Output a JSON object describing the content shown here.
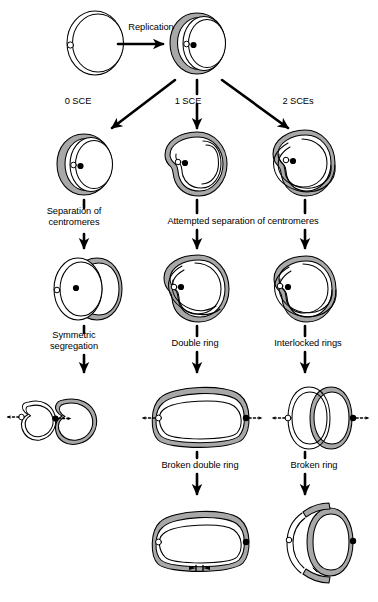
{
  "figure": {
    "width": 378,
    "height": 602,
    "background": "#ffffff",
    "ink_color": "#000000",
    "shaded_strand_color": "#a8a8a8",
    "unshaded_strand_color": "#ffffff"
  },
  "labels": {
    "replication": "Replication",
    "sce_zero": "0 SCE",
    "sce_one": "1 SCE",
    "sce_two": "2 SCEs",
    "separation_of_centromeres": "Separation of\ncentromeres",
    "attempted_separation": "Attempted separation of centromeres",
    "symmetric_segregation": "Symmetric\nsegregation",
    "double_ring": "Double ring",
    "interlocked_rings": "Interlocked rings",
    "broken_double_ring": "Broken double ring",
    "broken_ring": "Broken ring"
  },
  "label_positions": {
    "replication": {
      "x": 112,
      "y": 22,
      "w": 78
    },
    "sce_zero": {
      "x": 52,
      "y": 96,
      "w": 52
    },
    "sce_one": {
      "x": 162,
      "y": 96,
      "w": 52
    },
    "sce_two": {
      "x": 270,
      "y": 96,
      "w": 56
    },
    "separation_of_centromeres": {
      "x": 24,
      "y": 206,
      "w": 100
    },
    "attempted_separation": {
      "x": 128,
      "y": 216,
      "w": 230
    },
    "symmetric_segregation": {
      "x": 26,
      "y": 330,
      "w": 96
    },
    "double_ring": {
      "x": 156,
      "y": 338,
      "w": 78
    },
    "interlocked_rings": {
      "x": 258,
      "y": 338,
      "w": 100
    },
    "broken_double_ring": {
      "x": 138,
      "y": 460,
      "w": 124
    },
    "broken_ring": {
      "x": 268,
      "y": 460,
      "w": 92
    }
  },
  "stages": [
    {
      "id": "parent-ring",
      "name": "Parent ring chromosome",
      "row": 1,
      "column": "left",
      "description": "Single unreplicated ring chromosome, thin double outline, one unreplicated centromere shown as small open circle",
      "centromeres": [
        {
          "type": "open",
          "count": 1
        }
      ]
    },
    {
      "id": "replicated-ring",
      "name": "Replicated ring chromosome",
      "row": 1,
      "column": "center",
      "description": "Two sister chromatids after replication; one shaded gray, one unshaded white; open and filled centromeres adjacent",
      "centromeres": [
        {
          "type": "open",
          "count": 1
        },
        {
          "type": "filled",
          "count": 1
        }
      ]
    },
    {
      "id": "no-sce-ring",
      "name": "Ring after 0 SCE",
      "row": 2,
      "column": "left",
      "description": "Two free sister ring chromatids, one shaded one unshaded, lying side by side",
      "centromeres": [
        {
          "type": "open",
          "count": 1
        },
        {
          "type": "filled",
          "count": 1
        }
      ]
    },
    {
      "id": "one-sce-ring",
      "name": "Ring after 1 SCE",
      "row": 2,
      "column": "center",
      "description": "Single large double-sized ring formed by one sister chromatid exchange",
      "centromeres": [
        {
          "type": "open",
          "count": 1
        },
        {
          "type": "filled",
          "count": 1
        }
      ]
    },
    {
      "id": "two-sce-ring",
      "name": "Ring after 2 SCEs",
      "row": 2,
      "column": "right",
      "description": "Two interlocked (catenated) rings formed by two sister chromatid exchanges",
      "centromeres": [
        {
          "type": "open",
          "count": 1
        },
        {
          "type": "filled",
          "count": 1
        }
      ]
    },
    {
      "id": "symmetric-pair",
      "name": "Separated sister rings",
      "row": 3,
      "column": "left",
      "description": "Two independent rings side by side after successful centromere separation",
      "centromeres": [
        {
          "type": "open",
          "count": 1
        },
        {
          "type": "filled",
          "count": 1
        }
      ]
    },
    {
      "id": "double-ring-stage",
      "name": "Double ring",
      "row": 3,
      "column": "center",
      "description": "Single fused double-length ring; centromeres cannot separate",
      "centromeres": [
        {
          "type": "open",
          "count": 1
        },
        {
          "type": "filled",
          "count": 1
        }
      ]
    },
    {
      "id": "interlocked-stage",
      "name": "Interlocked rings",
      "row": 3,
      "column": "right",
      "description": "Two catenated rings that cannot be pulled apart",
      "centromeres": [
        {
          "type": "open",
          "count": 1
        },
        {
          "type": "filled",
          "count": 1
        }
      ]
    },
    {
      "id": "symmetric-result",
      "name": "Symmetric segregation result",
      "row": 4,
      "column": "left",
      "description": "Two separate rings pulled to opposite poles by spindle fibers; normal outcome",
      "centromeres": [
        {
          "type": "open",
          "count": 1
        },
        {
          "type": "filled",
          "count": 1
        }
      ],
      "spindle_arrows": 2
    },
    {
      "id": "stretched-double-ring",
      "name": "Stretched double ring",
      "row": 4,
      "column": "center",
      "description": "Double ring stretched into an elongated rounded rectangle by opposing spindle forces",
      "centromeres": [
        {
          "type": "open",
          "count": 1
        },
        {
          "type": "filled",
          "count": 1
        }
      ],
      "spindle_arrows": 2
    },
    {
      "id": "stretched-interlocked",
      "name": "Stretched interlocked rings",
      "row": 4,
      "column": "right",
      "description": "Interlocked rings pulled in opposite directions, deformed but still catenated",
      "centromeres": [
        {
          "type": "open",
          "count": 1
        },
        {
          "type": "filled",
          "count": 1
        }
      ],
      "spindle_arrows": 2
    },
    {
      "id": "broken-double-ring-result",
      "name": "Broken double ring",
      "row": 5,
      "column": "center",
      "description": "Double ring after breakage; gaps visible in the chromatid at the break points",
      "centromeres": [
        {
          "type": "open",
          "count": 1
        },
        {
          "type": "filled",
          "count": 1
        }
      ]
    },
    {
      "id": "broken-ring-result",
      "name": "Broken ring",
      "row": 5,
      "column": "right",
      "description": "Interlocked rings after breakage; outer ring fragmented into arcs, inner ring intact",
      "centromeres": [
        {
          "type": "open",
          "count": 1
        },
        {
          "type": "filled",
          "count": 1
        }
      ]
    }
  ],
  "connectors": [
    {
      "id": "arrow-replication",
      "type": "horizontal-arrow",
      "from": "parent-ring",
      "to": "replicated-ring",
      "label": "Replication"
    },
    {
      "id": "arrow-0-sce",
      "type": "diagonal-arrow",
      "from": "replicated-ring",
      "to": "no-sce-ring",
      "label": "0 SCE"
    },
    {
      "id": "arrow-1-sce",
      "type": "vertical-arrow",
      "from": "replicated-ring",
      "to": "one-sce-ring",
      "label": "1 SCE"
    },
    {
      "id": "arrow-2-sce",
      "type": "diagonal-arrow",
      "from": "replicated-ring",
      "to": "two-sce-ring",
      "label": "2 SCEs"
    },
    {
      "id": "arrow-sep-left",
      "type": "vertical-arrow",
      "from": "no-sce-ring",
      "to": "symmetric-pair",
      "label": "Separation of centromeres"
    },
    {
      "id": "arrow-sep-center",
      "type": "vertical-arrow",
      "from": "one-sce-ring",
      "to": "double-ring-stage",
      "label": "Attempted separation of centromeres"
    },
    {
      "id": "arrow-sep-right",
      "type": "vertical-arrow",
      "from": "two-sce-ring",
      "to": "interlocked-stage",
      "label": "Attempted separation of centromeres"
    },
    {
      "id": "arrow-symmetric",
      "type": "vertical-arrow",
      "from": "symmetric-pair",
      "to": "symmetric-result",
      "label": "Symmetric segregation"
    },
    {
      "id": "arrow-double-ring",
      "type": "vertical-arrow",
      "from": "double-ring-stage",
      "to": "stretched-double-ring",
      "label": "Double ring"
    },
    {
      "id": "arrow-interlocked",
      "type": "vertical-arrow",
      "from": "interlocked-stage",
      "to": "stretched-interlocked",
      "label": "Interlocked rings"
    },
    {
      "id": "arrow-broken-double",
      "type": "vertical-arrow",
      "from": "stretched-double-ring",
      "to": "broken-double-ring-result",
      "label": "Broken double ring"
    },
    {
      "id": "arrow-broken-ring",
      "type": "vertical-arrow",
      "from": "stretched-interlocked",
      "to": "broken-ring-result",
      "label": "Broken ring"
    }
  ]
}
